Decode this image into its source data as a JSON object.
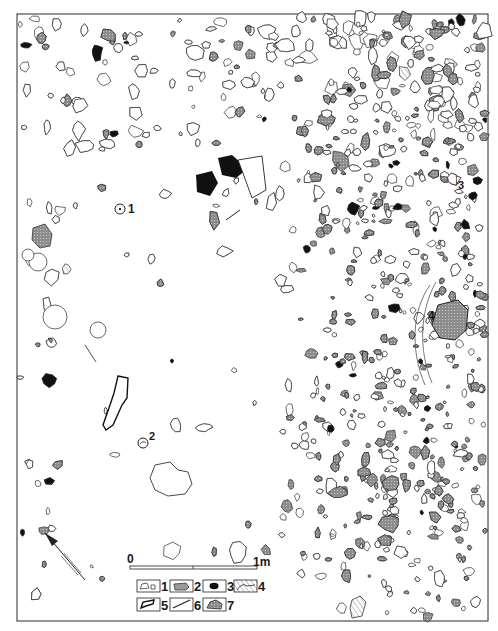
{
  "figure": {
    "type": "archaeological excavation plan",
    "frame": {
      "x": 17,
      "y": 14,
      "width": 471,
      "height": 607
    }
  },
  "colors": {
    "line": "#2a2a2a",
    "stone_grey": "#9a9a9a",
    "stone_dark": "#111111",
    "background": "#ffffff",
    "hatch": "#555555"
  },
  "feature_labels": [
    {
      "id": "1",
      "text": "1",
      "x": 128,
      "y": 213
    },
    {
      "id": "2",
      "text": "2",
      "x": 149,
      "y": 440
    },
    {
      "id": "3",
      "text": "3",
      "x": 458,
      "y": 189
    },
    {
      "id": "4",
      "text": "4",
      "x": 428,
      "y": 320
    }
  ],
  "scale_bar": {
    "start_label": "0",
    "end_label": "1m",
    "x1": 130,
    "x2": 257,
    "y": 568
  },
  "legend": {
    "items": [
      {
        "num": "1",
        "desc": "unshaded outline (bone / stone)"
      },
      {
        "num": "2",
        "desc": "grey-shaded stone"
      },
      {
        "num": "3",
        "desc": "black (burnt) stone"
      },
      {
        "num": "4",
        "desc": "hatched feature"
      },
      {
        "num": "5",
        "desc": "bold outline"
      },
      {
        "num": "6",
        "desc": "line / rod"
      },
      {
        "num": "7",
        "desc": "dotted grey stone with outline"
      }
    ]
  },
  "north_arrow": {
    "label": "north-arrow",
    "x1": 42,
    "y1": 533,
    "x2": 85,
    "y2": 580
  }
}
